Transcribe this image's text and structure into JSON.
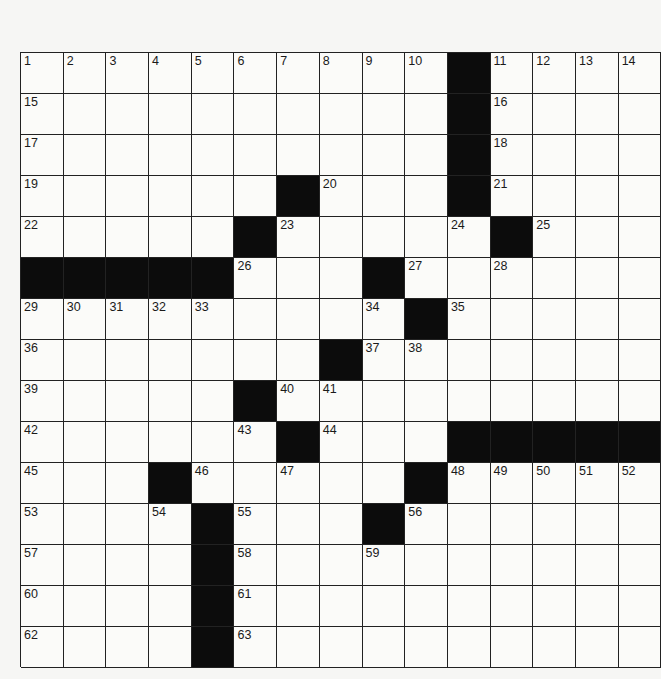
{
  "puzzle": {
    "rows": 15,
    "cols": 15,
    "grid": [
      "..........#....",
      "..........#....",
      "..........#....",
      "......#...#....",
      ".....#.....#...",
      "#####...#......",
      ".........#.....",
      ".......#.......",
      ".....#.........",
      "......#...#####",
      "...#.....#.....",
      "....#...#......",
      "....#..........",
      "....#..........",
      "....#.........."
    ],
    "numbers": [
      {
        "r": 0,
        "c": 0,
        "n": "1"
      },
      {
        "r": 0,
        "c": 1,
        "n": "2"
      },
      {
        "r": 0,
        "c": 2,
        "n": "3"
      },
      {
        "r": 0,
        "c": 3,
        "n": "4"
      },
      {
        "r": 0,
        "c": 4,
        "n": "5"
      },
      {
        "r": 0,
        "c": 5,
        "n": "6"
      },
      {
        "r": 0,
        "c": 6,
        "n": "7"
      },
      {
        "r": 0,
        "c": 7,
        "n": "8"
      },
      {
        "r": 0,
        "c": 8,
        "n": "9"
      },
      {
        "r": 0,
        "c": 9,
        "n": "10"
      },
      {
        "r": 0,
        "c": 11,
        "n": "11"
      },
      {
        "r": 0,
        "c": 12,
        "n": "12"
      },
      {
        "r": 0,
        "c": 13,
        "n": "13"
      },
      {
        "r": 0,
        "c": 14,
        "n": "14"
      },
      {
        "r": 1,
        "c": 0,
        "n": "15"
      },
      {
        "r": 1,
        "c": 11,
        "n": "16"
      },
      {
        "r": 2,
        "c": 0,
        "n": "17"
      },
      {
        "r": 2,
        "c": 11,
        "n": "18"
      },
      {
        "r": 3,
        "c": 0,
        "n": "19"
      },
      {
        "r": 3,
        "c": 7,
        "n": "20"
      },
      {
        "r": 3,
        "c": 11,
        "n": "21"
      },
      {
        "r": 4,
        "c": 0,
        "n": "22"
      },
      {
        "r": 4,
        "c": 6,
        "n": "23"
      },
      {
        "r": 4,
        "c": 10,
        "n": "24"
      },
      {
        "r": 4,
        "c": 12,
        "n": "25"
      },
      {
        "r": 5,
        "c": 5,
        "n": "26"
      },
      {
        "r": 5,
        "c": 9,
        "n": "27"
      },
      {
        "r": 5,
        "c": 11,
        "n": "28"
      },
      {
        "r": 6,
        "c": 0,
        "n": "29"
      },
      {
        "r": 6,
        "c": 1,
        "n": "30"
      },
      {
        "r": 6,
        "c": 2,
        "n": "31"
      },
      {
        "r": 6,
        "c": 3,
        "n": "32"
      },
      {
        "r": 6,
        "c": 4,
        "n": "33"
      },
      {
        "r": 6,
        "c": 8,
        "n": "34"
      },
      {
        "r": 6,
        "c": 10,
        "n": "35"
      },
      {
        "r": 7,
        "c": 0,
        "n": "36"
      },
      {
        "r": 7,
        "c": 8,
        "n": "37"
      },
      {
        "r": 7,
        "c": 9,
        "n": "38"
      },
      {
        "r": 8,
        "c": 0,
        "n": "39"
      },
      {
        "r": 8,
        "c": 6,
        "n": "40"
      },
      {
        "r": 8,
        "c": 7,
        "n": "41"
      },
      {
        "r": 9,
        "c": 0,
        "n": "42"
      },
      {
        "r": 9,
        "c": 5,
        "n": "43"
      },
      {
        "r": 9,
        "c": 7,
        "n": "44"
      },
      {
        "r": 10,
        "c": 0,
        "n": "45"
      },
      {
        "r": 10,
        "c": 4,
        "n": "46"
      },
      {
        "r": 10,
        "c": 6,
        "n": "47"
      },
      {
        "r": 10,
        "c": 10,
        "n": "48"
      },
      {
        "r": 10,
        "c": 11,
        "n": "49"
      },
      {
        "r": 10,
        "c": 12,
        "n": "50"
      },
      {
        "r": 10,
        "c": 13,
        "n": "51"
      },
      {
        "r": 10,
        "c": 14,
        "n": "52"
      },
      {
        "r": 11,
        "c": 0,
        "n": "53"
      },
      {
        "r": 11,
        "c": 3,
        "n": "54"
      },
      {
        "r": 11,
        "c": 5,
        "n": "55"
      },
      {
        "r": 11,
        "c": 9,
        "n": "56"
      },
      {
        "r": 12,
        "c": 0,
        "n": "57"
      },
      {
        "r": 12,
        "c": 5,
        "n": "58"
      },
      {
        "r": 12,
        "c": 8,
        "n": "59"
      },
      {
        "r": 13,
        "c": 0,
        "n": "60"
      },
      {
        "r": 13,
        "c": 5,
        "n": "61"
      },
      {
        "r": 14,
        "c": 0,
        "n": "62"
      },
      {
        "r": 14,
        "c": 5,
        "n": "63"
      }
    ],
    "colors": {
      "block": "#0c0c0c",
      "cell": "#fbfbf9",
      "line": "#222222",
      "paper": "#f6f6f4"
    }
  }
}
